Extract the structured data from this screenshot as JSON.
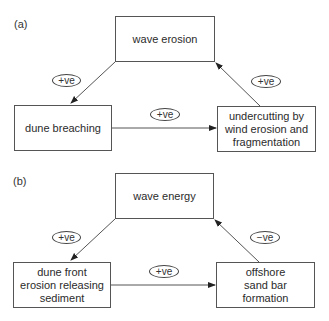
{
  "diagrams": [
    {
      "label": "(a)",
      "nodes": {
        "top": {
          "lines": [
            "wave erosion"
          ]
        },
        "left": {
          "lines": [
            "dune breaching"
          ]
        },
        "right": {
          "lines": [
            "undercutting by",
            "wind erosion and",
            "fragmentation"
          ]
        }
      },
      "edges": {
        "top_to_left": {
          "sign": "+ve"
        },
        "left_to_right": {
          "sign": "+ve"
        },
        "right_to_top": {
          "sign": "+ve"
        }
      }
    },
    {
      "label": "(b)",
      "nodes": {
        "top": {
          "lines": [
            "wave energy"
          ]
        },
        "left": {
          "lines": [
            "dune front",
            "erosion releasing",
            "sediment"
          ]
        },
        "right": {
          "lines": [
            "offshore",
            "sand bar",
            "formation"
          ]
        }
      },
      "edges": {
        "top_to_left": {
          "sign": "+ve"
        },
        "left_to_right": {
          "sign": "+ve"
        },
        "right_to_top": {
          "sign": "−ve"
        }
      }
    }
  ],
  "colors": {
    "line": "#444444",
    "text": "#2b2b2b",
    "background": "#ffffff"
  }
}
